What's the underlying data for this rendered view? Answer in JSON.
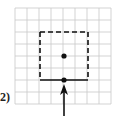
{
  "problem": {
    "label": "2)",
    "grid": {
      "cols": 8,
      "rows": 8,
      "cell": 12,
      "origin_x": 15,
      "origin_y": 8,
      "line_color": "#c8c8c8"
    },
    "square": {
      "x1": 40,
      "y1": 32,
      "x2": 88,
      "y2": 80,
      "dashed_sides": [
        "top",
        "left",
        "right"
      ],
      "solid_sides": [
        "bottom"
      ],
      "color": "#111111"
    },
    "points": [
      {
        "name": "center",
        "x": 64,
        "y": 56
      },
      {
        "name": "bottom-midpoint",
        "x": 64,
        "y": 80
      }
    ],
    "arrow": {
      "x": 64,
      "from_y": 116,
      "to_y": 84,
      "direction": "up"
    }
  }
}
